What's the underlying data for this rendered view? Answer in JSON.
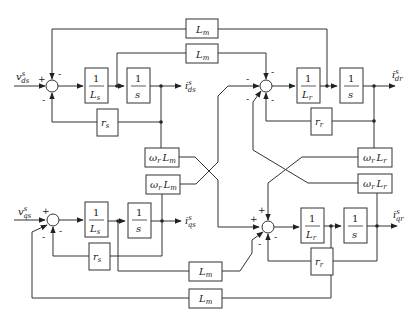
{
  "diagram": {
    "inputs": {
      "vds": {
        "base": "v",
        "sup": "s",
        "sub": "ds"
      },
      "vqs": {
        "base": "v",
        "sup": "s",
        "sub": "qs"
      }
    },
    "outputs": {
      "ids": {
        "base": "i",
        "sup": "s",
        "sub": "ds"
      },
      "iqs": {
        "base": "i",
        "sup": "s",
        "sub": "qs"
      },
      "idr": {
        "base": "i",
        "sup": "s",
        "sub": "dr"
      },
      "iqr": {
        "base": "i",
        "sup": "s",
        "sub": "qr"
      }
    },
    "blocks": {
      "inv_Ls_d": {
        "num": "1",
        "den_base": "L",
        "den_sub": "s"
      },
      "integ_d_s": {
        "num": "1",
        "den": "s"
      },
      "rs_d": {
        "base": "r",
        "sub": "s"
      },
      "inv_Ls_q": {
        "num": "1",
        "den_base": "L",
        "den_sub": "s"
      },
      "integ_q_s": {
        "num": "1",
        "den": "s"
      },
      "rs_q": {
        "base": "r",
        "sub": "s"
      },
      "inv_Lr_d": {
        "num": "1",
        "den_base": "L",
        "den_sub": "r"
      },
      "integ_d_r": {
        "num": "1",
        "den": "s"
      },
      "rr_d": {
        "base": "r",
        "sub": "r"
      },
      "inv_Lr_q": {
        "num": "1",
        "den_base": "L",
        "den_sub": "r"
      },
      "integ_q_r": {
        "num": "1",
        "den": "s"
      },
      "rr_q": {
        "base": "r",
        "sub": "r"
      },
      "Lm_top1": {
        "base": "L",
        "sub": "m"
      },
      "Lm_top2": {
        "base": "L",
        "sub": "m"
      },
      "Lm_bot1": {
        "base": "L",
        "sub": "m"
      },
      "Lm_bot2": {
        "base": "L",
        "sub": "m"
      },
      "wrLm_1": {
        "w": "ω",
        "wsub": "r",
        "base": "L",
        "sub": "m"
      },
      "wrLm_2": {
        "w": "ω",
        "wsub": "r",
        "base": "L",
        "sub": "m"
      },
      "wrLr_1": {
        "w": "ω",
        "wsub": "r",
        "base": "L",
        "sub": "r"
      },
      "wrLr_2": {
        "w": "ω",
        "wsub": "r",
        "base": "L",
        "sub": "r"
      }
    },
    "signs": {
      "sum_ds": {
        "input": "+",
        "top": "-",
        "bottom": "-"
      },
      "sum_qs": {
        "input": "+",
        "bottom_left": "-",
        "bottom": "-"
      },
      "sum_dr": {
        "left": "-",
        "top": "-",
        "bottom_left": "-",
        "bottom": "-"
      },
      "sum_qr": {
        "left": "+",
        "top": "+",
        "bottom_left": "-",
        "bottom": "-"
      }
    }
  }
}
